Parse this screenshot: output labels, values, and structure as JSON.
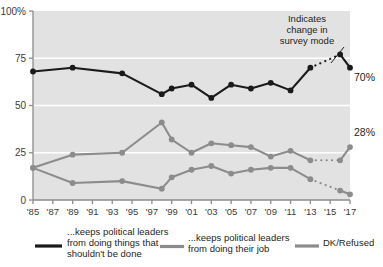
{
  "chart_data": {
    "type": "line",
    "title": "",
    "subtitle": "",
    "xlabel": "",
    "ylabel": "",
    "xlim": [
      1985,
      2017
    ],
    "ylim": [
      0,
      100
    ],
    "grid": "horizontal-white",
    "legend_position": "bottom",
    "x": [
      1985,
      1987,
      1989,
      1991,
      1993,
      1995,
      1997,
      1999,
      2001,
      2003,
      2005,
      2007,
      2009,
      2011,
      2013,
      2015,
      2017
    ],
    "tick_labels": [
      "'85",
      "'87",
      "'89",
      "'91",
      "'93",
      "'95",
      "'97",
      "'99",
      "'01",
      "'03",
      "'05",
      "'07",
      "'09",
      "'11",
      "'13",
      "'15",
      "'17"
    ],
    "ytick_labels": [
      "0",
      "25",
      "50",
      "75",
      "100%"
    ],
    "ytick_values": [
      0,
      25,
      50,
      75,
      100
    ],
    "series": [
      {
        "name": "...keeps political leaders from doing things that shouldn't be done",
        "short_name": "keeps-from-wrongdoing",
        "color": "#1a1a1a",
        "end_label": "70%",
        "points": [
          {
            "year": 1985,
            "value": 68,
            "dotted": false
          },
          {
            "year": 1989,
            "value": 70,
            "dotted": false
          },
          {
            "year": 1994,
            "value": 67,
            "dotted": false
          },
          {
            "year": 1998,
            "value": 56,
            "dotted": false
          },
          {
            "year": 1999,
            "value": 59,
            "dotted": false
          },
          {
            "year": 2001,
            "value": 61,
            "dotted": false
          },
          {
            "year": 2003,
            "value": 54,
            "dotted": false
          },
          {
            "year": 2005,
            "value": 61,
            "dotted": false
          },
          {
            "year": 2007,
            "value": 59,
            "dotted": false
          },
          {
            "year": 2009,
            "value": 62,
            "dotted": false
          },
          {
            "year": 2011,
            "value": 58,
            "dotted": false
          },
          {
            "year": 2013,
            "value": 70,
            "dotted": false
          },
          {
            "year": 2016,
            "value": 77,
            "dotted": true
          },
          {
            "year": 2017,
            "value": 70,
            "dotted": false
          }
        ]
      },
      {
        "name": "...keeps political leaders from doing their job",
        "short_name": "keeps-from-job",
        "color": "#8c8c8c",
        "end_label": "28%",
        "points": [
          {
            "year": 1985,
            "value": 17,
            "dotted": false
          },
          {
            "year": 1989,
            "value": 24,
            "dotted": false
          },
          {
            "year": 1994,
            "value": 25,
            "dotted": false
          },
          {
            "year": 1998,
            "value": 41,
            "dotted": false
          },
          {
            "year": 1999,
            "value": 32,
            "dotted": false
          },
          {
            "year": 2001,
            "value": 25,
            "dotted": false
          },
          {
            "year": 2003,
            "value": 30,
            "dotted": false
          },
          {
            "year": 2005,
            "value": 29,
            "dotted": false
          },
          {
            "year": 2007,
            "value": 28,
            "dotted": false
          },
          {
            "year": 2009,
            "value": 23,
            "dotted": false
          },
          {
            "year": 2011,
            "value": 26,
            "dotted": false
          },
          {
            "year": 2013,
            "value": 21,
            "dotted": false
          },
          {
            "year": 2016,
            "value": 21,
            "dotted": true
          },
          {
            "year": 2017,
            "value": 28,
            "dotted": false
          }
        ]
      },
      {
        "name": "DK/Refused",
        "short_name": "dk-refused",
        "color": "#8c8c8c",
        "end_label": "",
        "points": [
          {
            "year": 1985,
            "value": 17,
            "dotted": false
          },
          {
            "year": 1989,
            "value": 9,
            "dotted": false
          },
          {
            "year": 1994,
            "value": 10,
            "dotted": false
          },
          {
            "year": 1998,
            "value": 6,
            "dotted": false
          },
          {
            "year": 1999,
            "value": 12,
            "dotted": false
          },
          {
            "year": 2001,
            "value": 16,
            "dotted": false
          },
          {
            "year": 2003,
            "value": 18,
            "dotted": false
          },
          {
            "year": 2005,
            "value": 14,
            "dotted": false
          },
          {
            "year": 2007,
            "value": 16,
            "dotted": false
          },
          {
            "year": 2009,
            "value": 17,
            "dotted": false
          },
          {
            "year": 2011,
            "value": 17,
            "dotted": false
          },
          {
            "year": 2013,
            "value": 11,
            "dotted": false
          },
          {
            "year": 2016,
            "value": 5,
            "dotted": true
          },
          {
            "year": 2017,
            "value": 3,
            "dotted": false
          }
        ]
      }
    ],
    "annotations": [
      {
        "id": "survey-mode-note",
        "lines": [
          "Indicates",
          "change in",
          "survey mode"
        ],
        "text": "Indicates change in survey mode"
      }
    ]
  },
  "legend": {
    "items": [
      {
        "color": "#1a1a1a",
        "lines": [
          "...keeps political leaders",
          "from doing things that",
          "shouldn't be done"
        ]
      },
      {
        "color": "#8c8c8c",
        "lines": [
          "...keeps political leaders",
          "from doing their job"
        ]
      },
      {
        "color": "#8c8c8c",
        "lines": [
          "DK/Refused"
        ]
      }
    ]
  },
  "colors": {
    "plot_background": "#e2e2e2",
    "gridline": "#ffffff",
    "axis": "#8c8c8c",
    "dark_series": "#1a1a1a",
    "gray_series": "#8c8c8c",
    "text": "#231f20"
  }
}
